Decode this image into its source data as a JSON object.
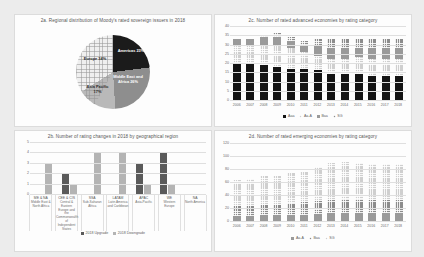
{
  "chart_data": [
    {
      "id": "2a",
      "type": "pie",
      "title": "2a. Regional distribution of Moody's rated sovereign issuers in 2018",
      "categories": [
        "Americas",
        "Middle East and Africa",
        "Asia Pacific",
        "Europe"
      ],
      "values": [
        23,
        26,
        17,
        34
      ],
      "labels": [
        "Americas 23%",
        "Middle East and Africa 26%",
        "Asia Pacific 17%",
        "Europe 34%"
      ],
      "colors": [
        "#1b1b1b",
        "#8e8e8e",
        "#b9b9b9",
        "#efefef"
      ],
      "legend": "none"
    },
    {
      "id": "2c",
      "type": "bar",
      "title": "2c. Number of rated advanced economies by rating category",
      "categories": [
        "2006",
        "2007",
        "2008",
        "2009",
        "2010",
        "2011",
        "2012",
        "2013",
        "2014",
        "2015",
        "2016",
        "2017",
        "2018"
      ],
      "series": [
        {
          "name": "Aaa",
          "values": [
            20,
            20,
            19,
            18,
            17,
            17,
            16,
            14,
            14,
            14,
            13,
            13,
            13
          ]
        },
        {
          "name": "Aa-A",
          "values": [
            10,
            10,
            11,
            12,
            11,
            9,
            8,
            8,
            8,
            9,
            9,
            9,
            9
          ]
        },
        {
          "name": "Baa",
          "values": [
            3,
            3,
            4,
            4,
            4,
            4,
            5,
            6,
            6,
            5,
            6,
            6,
            6
          ]
        },
        {
          "name": "SG",
          "values": [
            0,
            0,
            1,
            2,
            2,
            2,
            4,
            5,
            5,
            5,
            5,
            5,
            5
          ]
        }
      ],
      "totals": [
        33,
        33,
        35,
        36,
        34,
        32,
        33,
        33,
        33,
        33,
        33,
        33,
        33
      ],
      "ylabel": "",
      "xlabel": "",
      "ylim": [
        0,
        40
      ],
      "yticks": [
        "0",
        "5",
        "10",
        "15",
        "20",
        "25",
        "30",
        "35",
        "40"
      ],
      "grid": true,
      "legend_position": "bottom"
    },
    {
      "id": "2b",
      "type": "bar",
      "title": "2b. Number of rating changes in 2018 by geographical region",
      "categories": [
        "ME & NA",
        "CEE & CIS",
        "SSA",
        "LATAM",
        "APAC",
        "WE",
        "NA"
      ],
      "category_full": [
        "Middle East & North Africa",
        "Central & Eastern Europe and the Commonwealth of Independent States",
        "Sub-Saharan Africa",
        "Latin America and Caribbean",
        "Asia-Pacific",
        "Western Europe",
        "North America"
      ],
      "series": [
        {
          "name": "2018 Upgrade",
          "values": [
            0,
            2,
            0,
            0,
            3,
            4,
            0
          ]
        },
        {
          "name": "2018 Downgrade",
          "values": [
            3,
            1,
            4,
            4,
            1,
            1,
            0
          ]
        }
      ],
      "ylim": [
        0,
        5
      ],
      "yticks": [
        "0",
        "1",
        "2",
        "3",
        "4",
        "5"
      ],
      "grid": true,
      "legend_position": "bottom"
    },
    {
      "id": "2d",
      "type": "bar",
      "title": "2d. Number of rated emerging economies by rating category",
      "categories": [
        "2006",
        "2007",
        "2008",
        "2009",
        "2010",
        "2011",
        "2012",
        "2013",
        "2014",
        "2015",
        "2016",
        "2017",
        "2018"
      ],
      "series": [
        {
          "name": "Aa-A",
          "values": [
            8,
            8,
            9,
            9,
            10,
            10,
            11,
            12,
            12,
            12,
            12,
            12,
            12
          ]
        },
        {
          "name": "Baa",
          "values": [
            15,
            15,
            16,
            16,
            18,
            19,
            20,
            21,
            22,
            22,
            21,
            20,
            20
          ]
        },
        {
          "name": "SG",
          "values": [
            40,
            42,
            45,
            45,
            46,
            47,
            52,
            57,
            57,
            56,
            55,
            55,
            56
          ]
        }
      ],
      "totals": [
        63,
        65,
        70,
        70,
        74,
        76,
        83,
        90,
        91,
        90,
        88,
        87,
        88
      ],
      "ylim": [
        0,
        120
      ],
      "yticks": [
        "0",
        "20",
        "40",
        "60",
        "80",
        "100",
        "120"
      ],
      "grid": true,
      "legend_position": "bottom"
    }
  ]
}
